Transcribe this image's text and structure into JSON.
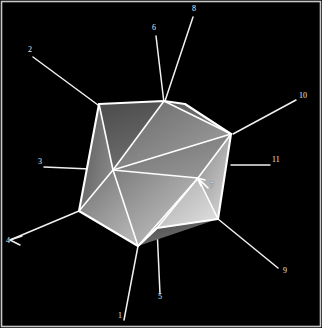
{
  "figure": {
    "background_color": "#000000",
    "border_color": "#c8c8c8",
    "line_color": "#f2f2f2",
    "label_color": "#e8e8e8",
    "width": 322,
    "height": 328
  },
  "solid": {
    "name": "icosahedron",
    "edge_color": "#ffffff",
    "shading": "grayscale gradient, lighter at lower-right faces, darker at upper-left faces",
    "faces_visible": 10,
    "silhouette_sides": 8
  },
  "labels": [
    {
      "id": "1",
      "text": "1",
      "x": 118,
      "y": 316,
      "leader": "from bottom edge up to lower-left vertex of the solid"
    },
    {
      "id": "2",
      "text": "2",
      "x": 28,
      "y": 50,
      "leader": "from upper-left down-right to upper-left vertex"
    },
    {
      "id": "3",
      "text": "3",
      "x": 38,
      "y": 162,
      "leader": "horizontal line right to left-middle vertex"
    },
    {
      "id": "4",
      "text": "4",
      "x": 6,
      "y": 241,
      "leader": "arrow pointing down-left away from lower-left vertex"
    },
    {
      "id": "5",
      "text": "5",
      "x": 158,
      "y": 297,
      "leader": "vertical line up to bottom vertex"
    },
    {
      "id": "6",
      "text": "6",
      "x": 152,
      "y": 28,
      "leader": "line down to top vertex"
    },
    {
      "id": "7",
      "text": "7",
      "x": 210,
      "y": 186,
      "leader": "short curved arrow pointing up-left to central vertex"
    },
    {
      "id": "8",
      "text": "8",
      "x": 192,
      "y": 9,
      "leader": "line down-left to upper vertex"
    },
    {
      "id": "9",
      "text": "9",
      "x": 283,
      "y": 271,
      "leader": "line up-left to lower-right vertex"
    },
    {
      "id": "10",
      "text": "10",
      "x": 299,
      "y": 96,
      "leader": "line down-left to right vertex"
    },
    {
      "id": "11",
      "text": "11",
      "x": 272,
      "y": 160,
      "leader": "horizontal line left to right vertex"
    }
  ]
}
